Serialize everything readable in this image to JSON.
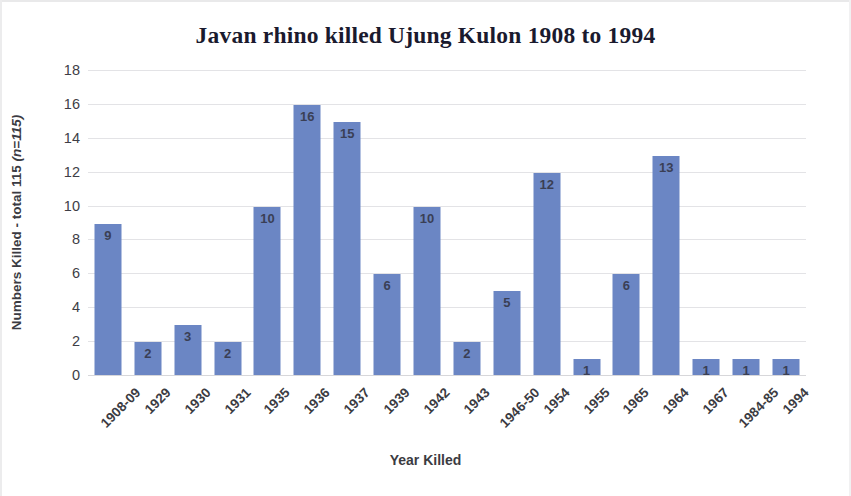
{
  "chart_data": {
    "type": "bar",
    "title": "Javan rhino killed Ujung Kulon 1908 to 1994",
    "xlabel": "Year Killed",
    "ylabel": "Numbers Killed - total 115 (n=115)",
    "ylabel_plain": "Numbers Killed - total 115 ",
    "ylabel_italic": "(n=115)",
    "categories": [
      "1908-09",
      "1929",
      "1930",
      "1931",
      "1935",
      "1936",
      "1937",
      "1939",
      "1942",
      "1943",
      "1946-50",
      "1954",
      "1955",
      "1965",
      "1964",
      "1967",
      "1984-85",
      "1994"
    ],
    "values": [
      9,
      2,
      3,
      2,
      10,
      16,
      15,
      6,
      10,
      2,
      5,
      12,
      1,
      6,
      13,
      1,
      1,
      1
    ],
    "ylim": [
      0,
      18
    ],
    "yticks": [
      0,
      2,
      4,
      6,
      8,
      10,
      12,
      14,
      16,
      18
    ],
    "ytick_labels": [
      "0",
      "2",
      "4",
      "6",
      "8",
      "10",
      "12",
      "14",
      "16",
      "18"
    ],
    "grid": true,
    "legend": "none",
    "bar_color": "#6b86c4",
    "label_color": "#3a3f55",
    "total": 115,
    "data_labels_inside": true
  }
}
